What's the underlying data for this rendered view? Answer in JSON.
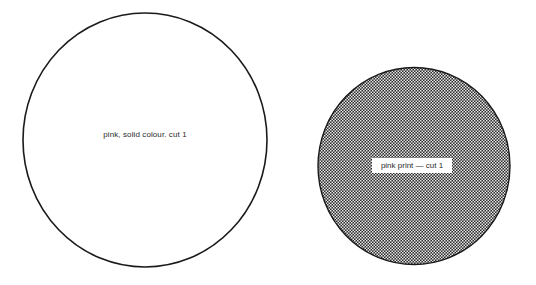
{
  "diagram": {
    "shapes": [
      {
        "id": "circle-solid",
        "fill": "solid white (outline only)",
        "label": "pink, solid colour. cut 1",
        "outline_color": "#1a1a1a"
      },
      {
        "id": "circle-print",
        "fill": "checkered print pattern",
        "label": "pink print — cut 1",
        "pattern_dark": "#2b2b2b",
        "pattern_light": "#ffffff"
      }
    ]
  }
}
